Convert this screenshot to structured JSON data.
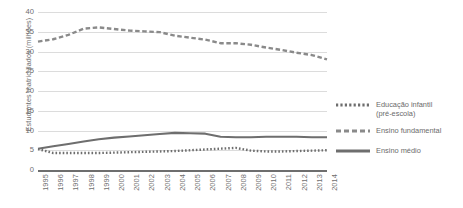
{
  "chart_data": {
    "type": "line",
    "title": "",
    "xlabel": "",
    "ylabel": "Estudantes matriculados (milhões)",
    "ylim": [
      0,
      40
    ],
    "yticks": [
      0,
      5,
      10,
      15,
      20,
      25,
      30,
      35,
      40
    ],
    "grid": true,
    "legend_position": "right",
    "x": [
      "1995",
      "1996",
      "1997",
      "1998",
      "1999",
      "2000",
      "2001",
      "2002",
      "2003",
      "2004",
      "2005",
      "2006",
      "2007",
      "2008",
      "2009",
      "2010",
      "2011",
      "2012",
      "2013",
      "2014"
    ],
    "series": [
      {
        "name": "Educação infantil (pré-escola)",
        "style": "dotted",
        "color": "#6e6e6e",
        "values": [
          5.3,
          4.3,
          4.3,
          4.3,
          4.3,
          4.4,
          4.5,
          4.6,
          4.7,
          4.8,
          5.0,
          5.2,
          5.4,
          5.6,
          4.9,
          4.7,
          4.7,
          4.8,
          4.9,
          5.0
        ]
      },
      {
        "name": "Ensino fundamental",
        "style": "dashed",
        "color": "#8a8a8a",
        "values": [
          32.5,
          33.1,
          34.2,
          35.8,
          36.1,
          35.7,
          35.3,
          35.1,
          34.9,
          34.0,
          33.5,
          33.0,
          32.1,
          32.1,
          31.7,
          31.0,
          30.4,
          29.7,
          29.1,
          28.0
        ]
      },
      {
        "name": "Ensino médio",
        "style": "solid",
        "color": "#6e6e6e",
        "values": [
          5.4,
          6.0,
          6.6,
          7.2,
          7.8,
          8.2,
          8.5,
          8.8,
          9.1,
          9.4,
          9.3,
          9.2,
          8.4,
          8.3,
          8.3,
          8.4,
          8.4,
          8.4,
          8.3,
          8.3
        ]
      }
    ]
  },
  "legend": {
    "items": [
      {
        "label_line1": "Educação infantil",
        "label_line2": "(pré-escola)",
        "style": "dotted"
      },
      {
        "label_line1": "Ensino fundamental",
        "label_line2": "",
        "style": "dashed"
      },
      {
        "label_line1": "Ensino médio",
        "label_line2": "",
        "style": "solid"
      }
    ]
  }
}
